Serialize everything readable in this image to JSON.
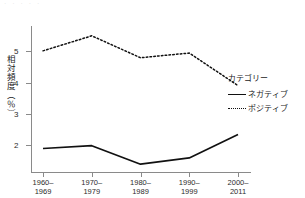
{
  "artifact": {
    "top_text": "· · · · ·"
  },
  "chart_data": {
    "type": "line",
    "title": "",
    "xlabel": "",
    "ylabel": "相対頻度（％）",
    "categories": [
      "1960–\n1969",
      "1970–\n1979",
      "1980–\n1989",
      "1990–\n1999",
      "2000–\n2011"
    ],
    "category_labels": [
      {
        "line1": "1960–",
        "line2": "1969"
      },
      {
        "line1": "1970–",
        "line2": "1979"
      },
      {
        "line1": "1980–",
        "line2": "1989"
      },
      {
        "line1": "1990–",
        "line2": "1999"
      },
      {
        "line1": "2000–",
        "line2": "2011"
      }
    ],
    "yticks": [
      2,
      3,
      4,
      5
    ],
    "ytick_labels": [
      "2",
      "3",
      "4",
      "5"
    ],
    "ylim": [
      1.15,
      5.75
    ],
    "grid": false,
    "legend_position": "right",
    "series": [
      {
        "name": "ネガティブ",
        "style": "solid",
        "color": "#111111",
        "values": [
          1.9,
          1.99,
          1.4,
          1.6,
          2.35
        ]
      },
      {
        "name": "ポジティブ",
        "style": "dotted",
        "color": "#111111",
        "values": [
          5.02,
          5.5,
          4.8,
          4.95,
          3.91
        ]
      }
    ]
  },
  "legend": {
    "title": "カテゴリー",
    "entries": [
      {
        "label": "ネガティブ",
        "style": "solid"
      },
      {
        "label": "ポジティブ",
        "style": "dotted"
      }
    ]
  }
}
